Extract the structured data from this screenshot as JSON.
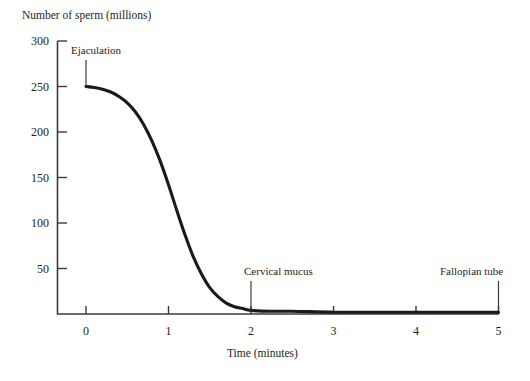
{
  "figure": {
    "background_color": "#ffffff",
    "ink_color": "#231f20",
    "curve_color": "#1a1a1a",
    "axis_color": "#3b3b3b"
  },
  "chart_data": {
    "type": "line",
    "title": "",
    "ylabel": "Number of sperm (millions)",
    "xlabel": "Time (minutes)",
    "xlim": [
      0,
      5
    ],
    "ylim": [
      0,
      300
    ],
    "grid": false,
    "legend": "none",
    "x_ticks": [
      0,
      1,
      2,
      3,
      4,
      5
    ],
    "x_tick_labels": [
      "0",
      "1",
      "2",
      "3",
      "4",
      "5"
    ],
    "y_ticks": [
      50,
      100,
      150,
      200,
      250,
      300
    ],
    "y_tick_labels": [
      "50",
      "100",
      "150",
      "200",
      "250",
      "300"
    ],
    "series": [
      {
        "name": "Number of sperm",
        "x": [
          0.0,
          0.1,
          0.2,
          0.3,
          0.4,
          0.5,
          0.6,
          0.7,
          0.8,
          0.9,
          1.0,
          1.1,
          1.2,
          1.3,
          1.4,
          1.5,
          1.6,
          1.7,
          1.8,
          1.9,
          2.0,
          2.25,
          2.5,
          3.0,
          3.5,
          4.0,
          4.5,
          5.0
        ],
        "values": [
          250,
          249,
          247,
          244,
          239,
          232,
          222,
          208,
          190,
          168,
          142,
          114,
          87,
          63,
          44,
          29,
          19,
          12,
          8,
          6,
          4,
          3,
          3,
          2,
          2,
          2,
          2,
          2
        ]
      }
    ],
    "annotations": [
      {
        "id": "ejaculation",
        "label": "Ejaculation",
        "x": 0,
        "y": 250,
        "label_position": "above-right"
      },
      {
        "id": "cervical-mucus",
        "label": "Cervical mucus",
        "x": 2,
        "y": 0,
        "label_position": "above"
      },
      {
        "id": "fallopian-tube",
        "label": "Fallopian tube",
        "x": 5,
        "y": 0,
        "label_position": "above-left"
      }
    ]
  },
  "labels": {
    "y_axis_title": "Number of sperm (millions)",
    "x_axis_title": "Time (minutes)",
    "y_ticks": [
      "300",
      "250",
      "200",
      "150",
      "100",
      "50"
    ],
    "x_ticks": [
      "0",
      "1",
      "2",
      "3",
      "4",
      "5"
    ],
    "annotation_ejaculation": "Ejaculation",
    "annotation_cervical_mucus": "Cervical mucus",
    "annotation_fallopian_tube": "Fallopian tube"
  }
}
